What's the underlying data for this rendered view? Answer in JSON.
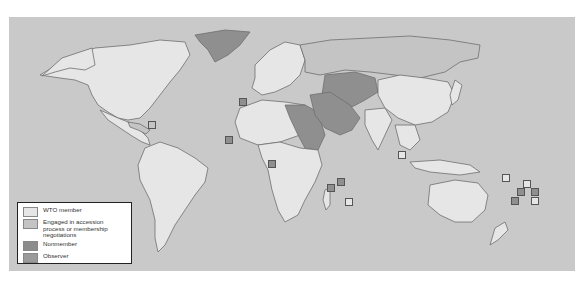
{
  "legend": {
    "items": [
      {
        "label": "WTO member",
        "color": "#e6e6e6"
      },
      {
        "label": "Engaged in accession process or membership negotiations",
        "color": "#c4c4c4"
      },
      {
        "label": "Nonmember",
        "color": "#8c8c8c"
      },
      {
        "label": "Observer",
        "color": "#9a9a9a"
      }
    ]
  },
  "colors": {
    "ocean": "#c9c9c9",
    "member": "#e6e6e6",
    "accession": "#c4c4c4",
    "nonmember": "#8f8f8f",
    "border": "#6e6e6e"
  },
  "markers": [
    {
      "x": 239,
      "y": 98,
      "status": "nonmember"
    },
    {
      "x": 148,
      "y": 121,
      "status": "accession"
    },
    {
      "x": 225,
      "y": 136,
      "status": "nonmember"
    },
    {
      "x": 268,
      "y": 160,
      "status": "nonmember"
    },
    {
      "x": 327,
      "y": 184,
      "status": "nonmember"
    },
    {
      "x": 337,
      "y": 178,
      "status": "nonmember"
    },
    {
      "x": 345,
      "y": 198,
      "status": "member"
    },
    {
      "x": 398,
      "y": 151,
      "status": "member"
    },
    {
      "x": 502,
      "y": 174,
      "status": "member"
    },
    {
      "x": 523,
      "y": 180,
      "status": "member"
    },
    {
      "x": 517,
      "y": 188,
      "status": "nonmember"
    },
    {
      "x": 531,
      "y": 188,
      "status": "nonmember"
    },
    {
      "x": 511,
      "y": 197,
      "status": "nonmember"
    },
    {
      "x": 531,
      "y": 197,
      "status": "member"
    }
  ]
}
